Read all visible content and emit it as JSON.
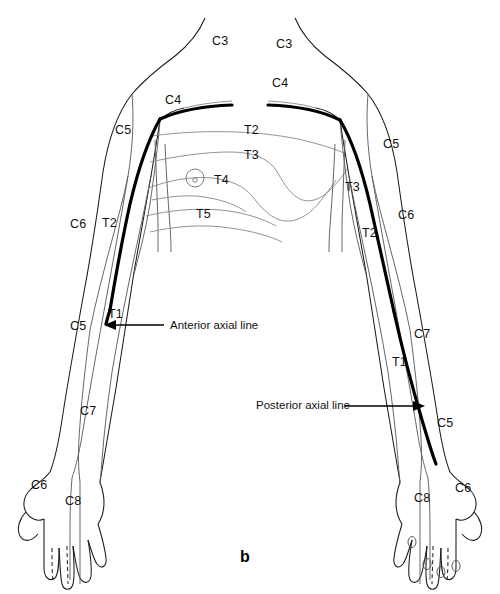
{
  "figure": {
    "caption": "b",
    "title_alt": "Dermatomes of the upper limbs and thorax, anterior view"
  },
  "annotations": [
    {
      "id": "anterior-axial-line",
      "text": "Anterior axial line",
      "x": 170,
      "y": 321,
      "arrow": "left"
    },
    {
      "id": "posterior-axial-line",
      "text": "Posterior axial line",
      "x": 256,
      "y": 400,
      "arrow": "right"
    }
  ],
  "dermatome_labels": {
    "left_side": [
      {
        "id": "left-c3-neck",
        "text": "C3",
        "x": 212,
        "y": 34
      },
      {
        "id": "left-c4-shoulder",
        "text": "C4",
        "x": 165,
        "y": 93
      },
      {
        "id": "left-c5-shoulder",
        "text": "C5",
        "x": 115,
        "y": 123
      },
      {
        "id": "left-c6-arm",
        "text": "C6",
        "x": 70,
        "y": 217
      },
      {
        "id": "left-t2-arm",
        "text": "T2",
        "x": 102,
        "y": 216
      },
      {
        "id": "left-t1-arm",
        "text": "T1",
        "x": 108,
        "y": 307
      },
      {
        "id": "left-c5-forearm",
        "text": "C5",
        "x": 70,
        "y": 319
      },
      {
        "id": "left-c7-forearm",
        "text": "C7",
        "x": 80,
        "y": 404
      },
      {
        "id": "left-c6-hand",
        "text": "C6",
        "x": 31,
        "y": 478
      },
      {
        "id": "left-c8-hand",
        "text": "C8",
        "x": 65,
        "y": 494
      }
    ],
    "trunk": [
      {
        "id": "trunk-t2",
        "text": "T2",
        "x": 244,
        "y": 123
      },
      {
        "id": "trunk-t3",
        "text": "T3",
        "x": 244,
        "y": 148
      },
      {
        "id": "trunk-t4",
        "text": "T4",
        "x": 214,
        "y": 173
      },
      {
        "id": "trunk-t5",
        "text": "T5",
        "x": 196,
        "y": 207
      }
    ],
    "right_side": [
      {
        "id": "right-c3-neck",
        "text": "C3",
        "x": 276,
        "y": 37
      },
      {
        "id": "right-c4-shoulder",
        "text": "C4",
        "x": 272,
        "y": 76
      },
      {
        "id": "right-c5-shoulder",
        "text": "C5",
        "x": 383,
        "y": 137
      },
      {
        "id": "right-t3-axilla",
        "text": "T3",
        "x": 345,
        "y": 180
      },
      {
        "id": "right-c6-arm",
        "text": "C6",
        "x": 398,
        "y": 208
      },
      {
        "id": "right-t2-arm",
        "text": "T2",
        "x": 362,
        "y": 226
      },
      {
        "id": "right-c7-arm",
        "text": "C7",
        "x": 414,
        "y": 327
      },
      {
        "id": "right-t1-arm",
        "text": "T1",
        "x": 392,
        "y": 355
      },
      {
        "id": "right-c5-forearm",
        "text": "C5",
        "x": 437,
        "y": 416
      },
      {
        "id": "right-c8-hand",
        "text": "C8",
        "x": 414,
        "y": 491
      },
      {
        "id": "right-c6-hand",
        "text": "C6",
        "x": 455,
        "y": 481
      }
    ]
  },
  "caption_position": {
    "x": 240,
    "y": 548
  }
}
